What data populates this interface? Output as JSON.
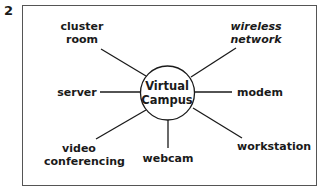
{
  "figure_number": "2",
  "diagram": {
    "type": "hub-and-spoke",
    "center": {
      "line1": "Virtual",
      "line2": "Campus"
    },
    "nodes": [
      {
        "id": "cluster-room",
        "line1": "cluster",
        "line2": "room",
        "italic": false
      },
      {
        "id": "wireless-network",
        "line1": "wireless",
        "line2": "network",
        "italic": true
      },
      {
        "id": "server",
        "line1": "server",
        "line2": "",
        "italic": false
      },
      {
        "id": "modem",
        "line1": "modem",
        "line2": "",
        "italic": false
      },
      {
        "id": "video-conferencing",
        "line1": "video",
        "line2": "conferencing",
        "italic": false
      },
      {
        "id": "webcam",
        "line1": "webcam",
        "line2": "",
        "italic": false
      },
      {
        "id": "workstation",
        "line1": "workstation",
        "line2": "",
        "italic": false
      }
    ]
  }
}
